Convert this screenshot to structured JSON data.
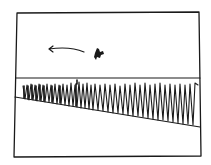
{
  "drawing": {
    "description": "Hand-drawn sketch: framed scene with a horizon line, a sloped ground line, a row of tall grass blades, and a small flying creature moving left indicated by an arrow",
    "stroke_color": "#1a1a1a",
    "background_color": "#ffffff",
    "elements": {
      "frame": "rectangle-frame",
      "horizon": "horizontal-line",
      "ground": "sloped-line",
      "grass": "grass-row",
      "creature": "flying-creature",
      "arrow": "left-arrow"
    }
  }
}
